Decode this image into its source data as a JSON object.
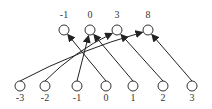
{
  "top_nodes": [
    {
      "label": "-1",
      "x": 64,
      "y": 30
    },
    {
      "label": "0",
      "x": 90,
      "y": 30
    },
    {
      "label": "3",
      "x": 117,
      "y": 30
    },
    {
      "label": "8",
      "x": 148,
      "y": 30
    }
  ],
  "bottom_nodes": [
    {
      "label": "-3",
      "x": 20,
      "y": 88
    },
    {
      "label": "-2",
      "x": 45,
      "y": 88
    },
    {
      "label": "-1",
      "x": 77,
      "y": 88
    },
    {
      "label": "0",
      "x": 106,
      "y": 88
    },
    {
      "label": "1",
      "x": 133,
      "y": 88
    },
    {
      "label": "2",
      "x": 163,
      "y": 88
    },
    {
      "label": "3",
      "x": 192,
      "y": 88
    }
  ],
  "edges": [
    {
      "from": "-3",
      "to": "8"
    },
    {
      "from": "-2",
      "to": "3"
    },
    {
      "from": "-1",
      "to": "0"
    },
    {
      "from": "0",
      "to": "-1"
    },
    {
      "from": "1",
      "to": "0"
    },
    {
      "from": "2",
      "to": "3"
    },
    {
      "from": "3",
      "to": "8"
    }
  ]
}
